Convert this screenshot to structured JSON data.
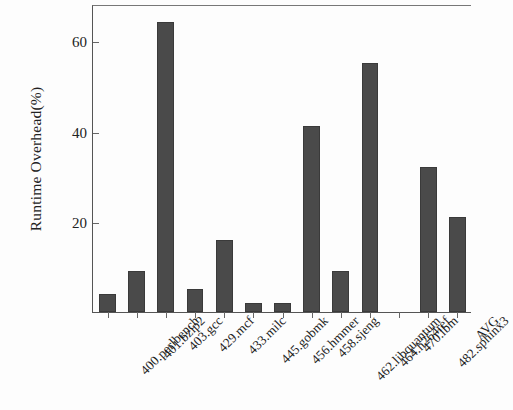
{
  "chart_data": {
    "type": "bar",
    "title": "",
    "xlabel": "",
    "ylabel": "Runtime Overhead(%)",
    "categories": [
      "400.perlbench",
      "401.bzip2",
      "403.gcc",
      "429.mcf",
      "433.milc",
      "445.gobmk",
      "456.hmmer",
      "458.sjeng",
      "462.libquantum",
      "464.h264ref",
      "470.lbm",
      "482.sphinx3",
      "AVG"
    ],
    "values": [
      4,
      9,
      64,
      5,
      16,
      2,
      2,
      41,
      9,
      55,
      0,
      32,
      21
    ],
    "ylim": [
      0,
      68
    ],
    "yticks": [
      20,
      40,
      60
    ],
    "ytick_labels": [
      "20",
      "40",
      "60"
    ],
    "grid": false,
    "legend": false,
    "bar_color": "#4a4a4a",
    "axis_color": "#555555",
    "background": "#fdfdfd"
  }
}
